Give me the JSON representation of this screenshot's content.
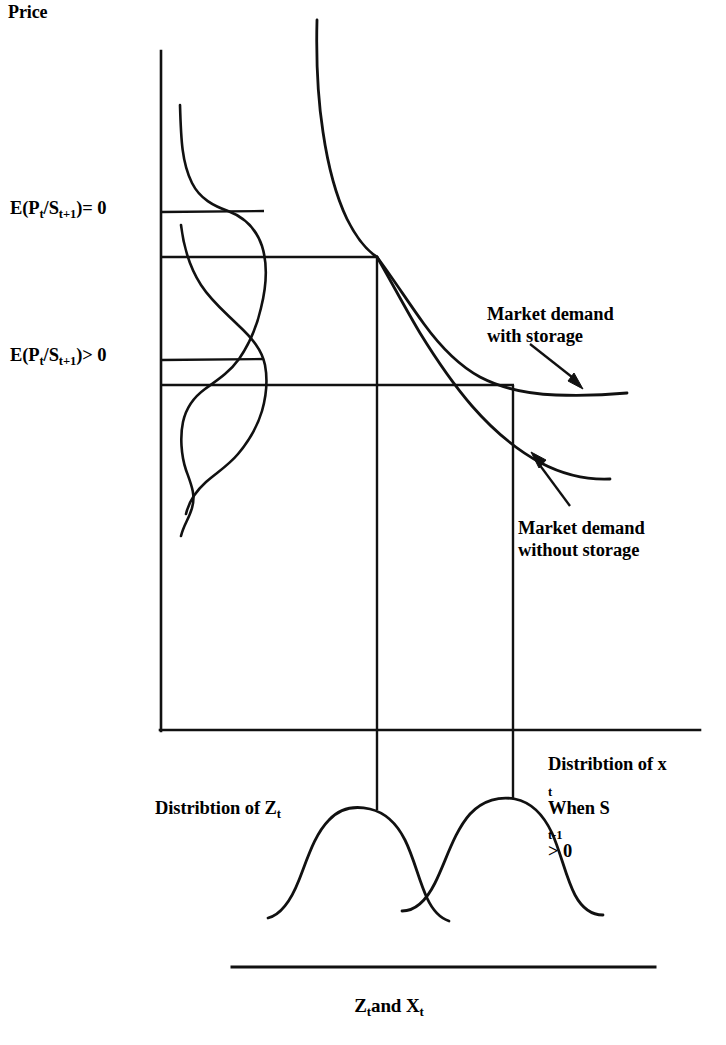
{
  "figure": {
    "axes": {
      "y_axis_label": "Price",
      "x_axis_label_parts": {
        "z": "Z",
        "sub_t1": "t",
        "and": "and X",
        "sub_t2": "t"
      },
      "x_axis_label_plain": "Zt and Xt"
    },
    "price_levels": [
      {
        "id": "expectation-zero",
        "text_parts": {
          "lead": "E(P",
          "sub1": "t",
          "mid": "/S",
          "sub2": "t+1",
          "tail": ")= 0"
        },
        "plain": "E(Pt/St+1)= 0",
        "y": 212
      },
      {
        "id": "expectation-positive",
        "text_parts": {
          "lead": "E(P",
          "sub1": "t",
          "mid": "/S",
          "sub2": "t+1",
          "tail": ")> 0"
        },
        "plain": "E(Pt/St+1)> 0",
        "y": 360
      }
    ],
    "annotations": [
      {
        "id": "market-demand-with-storage",
        "line1": "Market demand",
        "line2": "with storage",
        "plain": "Market demand with storage"
      },
      {
        "id": "market-demand-without-storage",
        "line1": "Market demand",
        "line2": "without storage",
        "plain": "Market demand without storage"
      }
    ],
    "distributions": [
      {
        "id": "distribution-of-z",
        "line1_parts": {
          "lead": "Distribtion of Z",
          "sub": "t"
        },
        "plain": "Distribtion of Z t"
      },
      {
        "id": "distribution-of-x",
        "line1_parts": {
          "lead": "Distribtion of x",
          "sub": "t"
        },
        "line2_parts": {
          "lead": "When S",
          "sub": "t-1",
          "tail": "> 0"
        },
        "plain": "Distribtion of x t When St-1 > 0"
      }
    ],
    "colors": {
      "ink": "#000000",
      "background": "#ffffff"
    }
  }
}
